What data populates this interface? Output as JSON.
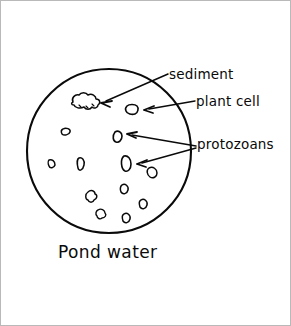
{
  "figure": {
    "caption": "Pond water",
    "background_color": "#ffffff",
    "ink_color": "#0a0a0a",
    "frame_color": "#b9b9b9"
  },
  "labels": [
    {
      "id": "sediment",
      "text": "sediment",
      "points_to": "irregular cloud-shaped clump in upper-left of field of view"
    },
    {
      "id": "plant_cell",
      "text": "plant cell",
      "points_to": "small rounded rectangular cell in upper-right of field of view"
    },
    {
      "id": "protozoans",
      "text": "protozoans",
      "points_to": "two small oval organisms in the middle of the field of view"
    }
  ],
  "field_of_view": {
    "shape": "circle",
    "center_x": 108,
    "center_y": 150,
    "radius": 82,
    "contents_count": 13
  },
  "particles": [
    {
      "kind": "sediment",
      "x": 84,
      "y": 101
    },
    {
      "kind": "plant-cell",
      "x": 131,
      "y": 108
    },
    {
      "kind": "protozoan",
      "x": 117,
      "y": 136
    },
    {
      "kind": "protozoan",
      "x": 126,
      "y": 162
    },
    {
      "kind": "debris",
      "x": 65,
      "y": 131
    },
    {
      "kind": "debris",
      "x": 51,
      "y": 163
    },
    {
      "kind": "debris",
      "x": 80,
      "y": 164
    },
    {
      "kind": "debris",
      "x": 91,
      "y": 196
    },
    {
      "kind": "debris",
      "x": 152,
      "y": 172
    },
    {
      "kind": "debris",
      "x": 124,
      "y": 188
    },
    {
      "kind": "debris",
      "x": 143,
      "y": 204
    },
    {
      "kind": "debris",
      "x": 126,
      "y": 218
    },
    {
      "kind": "debris",
      "x": 100,
      "y": 213
    }
  ]
}
